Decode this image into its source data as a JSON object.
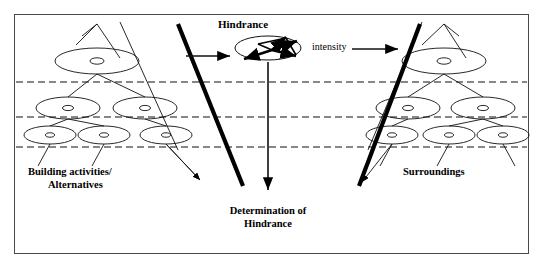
{
  "figure": {
    "type": "diagram",
    "title_visible": false,
    "background": "#ffffff",
    "border_color": "#4a4a4a",
    "ink_color": "#000000",
    "frame": {
      "x": 14,
      "y": 14,
      "width": 515,
      "height": 240
    }
  },
  "labels": {
    "hindrance": "Hindrance",
    "intensity": "intensity",
    "building_activities_line1": "Building activities/",
    "building_activities_line2": "Alternatives",
    "surroundings": "Surroundings",
    "determination_line1": "Determination of",
    "determination_line2": "Hindrance"
  },
  "structure": {
    "dashed_levels_y": [
      82,
      117,
      147
    ],
    "left_tree": {
      "name": "building-activities-tree",
      "levels": [
        {
          "level": 1,
          "nodes": [
            {
              "cx": 97,
              "cy": 61,
              "rx": 42,
              "ry": 13
            }
          ]
        },
        {
          "level": 2,
          "nodes": [
            {
              "cx": 68,
              "cy": 108,
              "rx": 32,
              "ry": 11
            },
            {
              "cx": 145,
              "cy": 108,
              "rx": 32,
              "ry": 11
            }
          ]
        },
        {
          "level": 3,
          "nodes": [
            {
              "cx": 50,
              "cy": 135,
              "rx": 26,
              "ry": 9
            },
            {
              "cx": 104,
              "cy": 135,
              "rx": 26,
              "ry": 9
            },
            {
              "cx": 166,
              "cy": 135,
              "rx": 26,
              "ry": 9
            }
          ]
        }
      ]
    },
    "right_tree": {
      "name": "surroundings-tree",
      "levels": [
        {
          "level": 1,
          "nodes": [
            {
              "cx": 444,
              "cy": 61,
              "rx": 42,
              "ry": 13
            }
          ]
        },
        {
          "level": 2,
          "nodes": [
            {
              "cx": 408,
              "cy": 108,
              "rx": 32,
              "ry": 11
            },
            {
              "cx": 483,
              "cy": 108,
              "rx": 32,
              "ry": 11
            }
          ]
        },
        {
          "level": 3,
          "nodes": [
            {
              "cx": 392,
              "cy": 135,
              "rx": 26,
              "ry": 9
            },
            {
              "cx": 449,
              "cy": 135,
              "rx": 26,
              "ry": 9
            },
            {
              "cx": 503,
              "cy": 135,
              "rx": 26,
              "ry": 9
            }
          ]
        }
      ]
    },
    "hindrance_node": {
      "cx": 268,
      "cy": 48,
      "rx": 33,
      "ry": 12
    },
    "arrows": {
      "into_hindrance": {
        "from": [
          186,
          56
        ],
        "to": [
          232,
          56
        ]
      },
      "intensity": {
        "from": [
          355,
          49
        ],
        "to": [
          398,
          49
        ]
      },
      "determination": {
        "from": [
          268,
          62
        ],
        "to": [
          268,
          192
        ]
      }
    },
    "thick_diagonals": [
      {
        "from": [
          178,
          24
        ],
        "to": [
          243,
          186
        ]
      },
      {
        "from": [
          359,
          186
        ],
        "to": [
          420,
          24
        ]
      }
    ]
  }
}
